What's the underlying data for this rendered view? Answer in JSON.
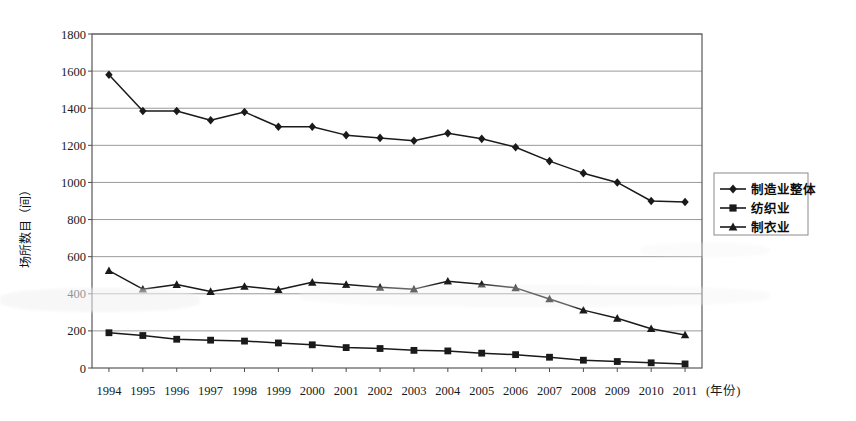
{
  "chart_data": {
    "type": "line",
    "title": "",
    "xlabel": "(年份)",
    "ylabel": "场所数目（间）",
    "categories": [
      "1994",
      "1995",
      "1996",
      "1997",
      "1998",
      "1999",
      "2000",
      "2001",
      "2002",
      "2003",
      "2004",
      "2005",
      "2006",
      "2007",
      "2008",
      "2009",
      "2010",
      "2011"
    ],
    "x_axis_suffix": "(年份)",
    "ylim": [
      0,
      1800
    ],
    "ytick_step": 200,
    "yticks": [
      "1800",
      "1600",
      "1400",
      "1200",
      "1000",
      "800",
      "600",
      "400",
      "200",
      "0"
    ],
    "grid": "horizontal",
    "legend_position": "right",
    "series": [
      {
        "name": "制造业整体",
        "marker": "diamond",
        "values": [
          1580,
          1385,
          1385,
          1335,
          1380,
          1300,
          1300,
          1255,
          1240,
          1225,
          1265,
          1235,
          1190,
          1115,
          1050,
          1000,
          900,
          895
        ]
      },
      {
        "name": "纺织业",
        "marker": "square",
        "values": [
          190,
          175,
          155,
          150,
          145,
          135,
          125,
          110,
          105,
          95,
          92,
          80,
          72,
          58,
          42,
          35,
          28,
          22
        ]
      },
      {
        "name": "制衣业",
        "marker": "triangle",
        "values": [
          525,
          425,
          450,
          412,
          440,
          422,
          462,
          450,
          435,
          425,
          468,
          452,
          432,
          372,
          312,
          268,
          212,
          178
        ]
      }
    ]
  },
  "legend": {
    "items": [
      {
        "label": "制造业整体",
        "marker": "diamond"
      },
      {
        "label": "纺织业",
        "marker": "square"
      },
      {
        "label": "制衣业",
        "marker": "triangle"
      }
    ]
  },
  "colors": {
    "series_line": "#1a1a1a",
    "grid": "#9a9a9a",
    "axis": "#4d4d4d",
    "background": "#ffffff",
    "text": "#111111"
  }
}
